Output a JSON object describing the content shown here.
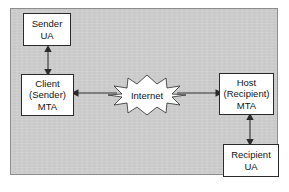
{
  "diagram": {
    "background_color": "#cdcdcd",
    "panel_border_color": "#8d8d8d",
    "node_fill_color": "#ffffff",
    "node_border_color": "#2b2b2b",
    "line_color": "#333333",
    "nodes": [
      {
        "id": "sender-ua",
        "lines": [
          "Sender",
          "UA"
        ],
        "shape": "rectangle"
      },
      {
        "id": "client-mta",
        "lines": [
          "Client",
          "(Sender)",
          "MTA"
        ],
        "shape": "rectangle"
      },
      {
        "id": "host-mta",
        "lines": [
          "Host",
          "(Recipient)",
          "MTA"
        ],
        "shape": "rectangle"
      },
      {
        "id": "recipient-ua",
        "lines": [
          "Recipient",
          "UA"
        ],
        "shape": "rectangle"
      }
    ],
    "cloud": {
      "id": "internet",
      "label": "Internet",
      "shape": "starburst"
    },
    "connectors": [
      {
        "id": "sender-ua-to-client-mta",
        "from": "sender-ua",
        "to": "client-mta",
        "orientation": "vertical",
        "arrowheads": "both"
      },
      {
        "id": "internet-to-client-mta",
        "from": "internet",
        "to": "client-mta",
        "orientation": "horizontal",
        "arrowheads": "left"
      },
      {
        "id": "internet-to-host-mta",
        "from": "internet",
        "to": "host-mta",
        "orientation": "horizontal",
        "arrowheads": "right"
      },
      {
        "id": "host-mta-to-recipient-ua",
        "from": "host-mta",
        "to": "recipient-ua",
        "orientation": "vertical",
        "arrowheads": "both"
      }
    ]
  }
}
